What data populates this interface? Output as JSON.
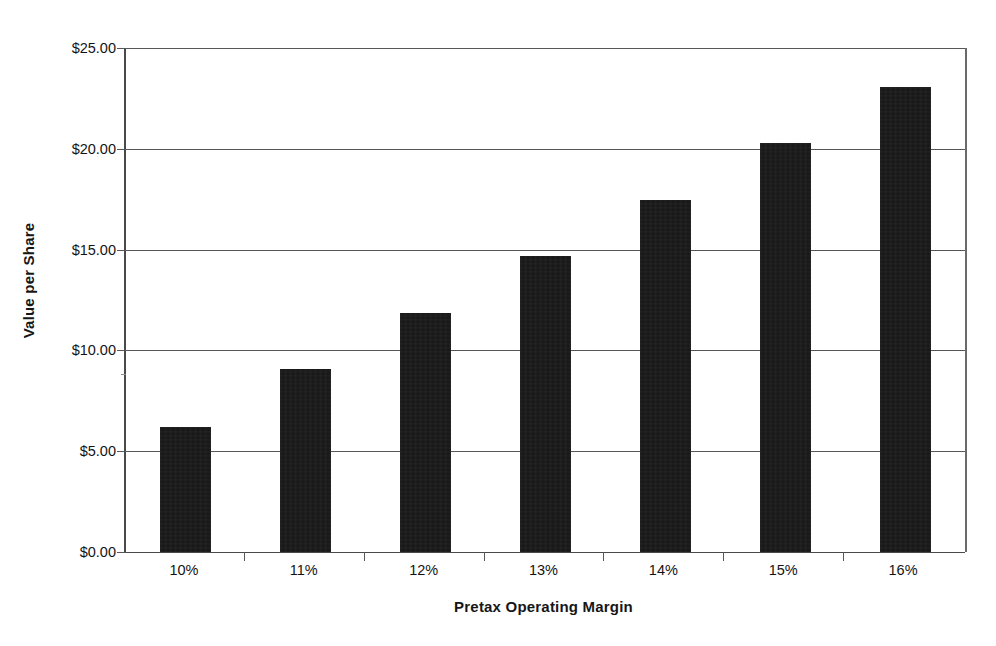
{
  "chart_data": {
    "type": "bar",
    "title": "",
    "subtitle": "",
    "xlabel": "Pretax Operating Margin",
    "ylabel": "Value per Share",
    "categories": [
      "10%",
      "11%",
      "12%",
      "13%",
      "14%",
      "15%",
      "16%"
    ],
    "values": [
      6.2,
      9.1,
      11.85,
      14.7,
      17.45,
      20.3,
      23.05
    ],
    "series": [
      {
        "name": "Value per Share",
        "values": [
          6.2,
          9.1,
          11.85,
          14.7,
          17.45,
          20.3,
          23.05
        ],
        "color": "#151515"
      }
    ],
    "ylim": [
      0,
      25
    ],
    "ytick_values": [
      0,
      5,
      10,
      15,
      20,
      25
    ],
    "ytick_labels": [
      "$0.00",
      "$5.00",
      "$10.00",
      "$15.00",
      "$20.00",
      "$25.00"
    ],
    "grid": true,
    "grid_axis": "y",
    "legend": false,
    "legend_position": "none",
    "bar_color": "#151515",
    "axis_color": "#55575a",
    "background": "#ffffff",
    "annotations": []
  },
  "axis": {
    "y_title": "Value per Share",
    "x_title": "Pretax Operating Margin"
  }
}
